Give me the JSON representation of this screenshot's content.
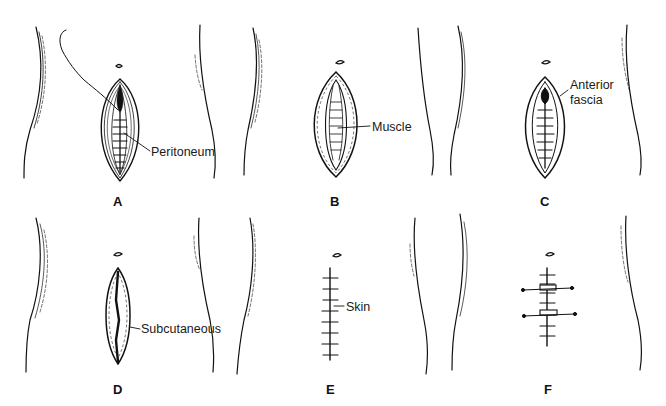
{
  "figure": {
    "panels": [
      {
        "id": "A",
        "letter": "A",
        "annotation": "Peritoneum"
      },
      {
        "id": "B",
        "letter": "B",
        "annotation": "Muscle"
      },
      {
        "id": "C",
        "letter": "C",
        "annotation_line1": "Anterior",
        "annotation_line2": "fascia"
      },
      {
        "id": "D",
        "letter": "D",
        "annotation": "Subcutaneous"
      },
      {
        "id": "E",
        "letter": "E",
        "annotation": "Skin"
      },
      {
        "id": "F",
        "letter": "F",
        "annotation": ""
      }
    ]
  },
  "colors": {
    "ink": "#111111",
    "background": "#ffffff"
  }
}
